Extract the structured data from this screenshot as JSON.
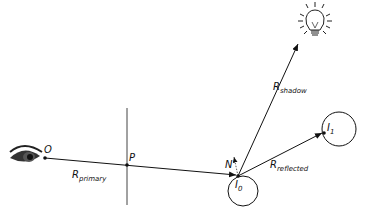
{
  "diagram": {
    "points": {
      "origin": "O",
      "pixel": "P",
      "normal": "N",
      "intersection0": {
        "base": "I",
        "sub": "0"
      },
      "intersection1": {
        "base": "I",
        "sub": "1"
      }
    },
    "rays": {
      "primary": {
        "base": "R",
        "sub": "primary"
      },
      "shadow": {
        "base": "R",
        "sub": "shadow"
      },
      "reflected": {
        "base": "R",
        "sub": "reflected"
      }
    },
    "icons": [
      "eye-icon",
      "light-bulb-icon"
    ],
    "colors": {
      "ink": "#111111",
      "background": "#ffffff"
    }
  }
}
